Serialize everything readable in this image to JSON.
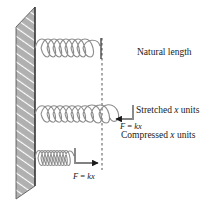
{
  "figure": {
    "background_color": "#ffffff",
    "ink_color": "#1a1a1a",
    "wall_fill": "#b3b3b3",
    "wall_hatch_color": "#ffffff",
    "spring_color": "#8c8c8c"
  },
  "labels": {
    "natural_length": "Natural length",
    "stretched_prefix": "Stretched ",
    "stretched_var": "x",
    "stretched_suffix": " units",
    "compressed_prefix": "Compressed ",
    "compressed_var": "x",
    "compressed_suffix": " units"
  },
  "formulas": {
    "stretched_force_lhs": "F",
    "stretched_force_eq": " = ",
    "stretched_force_k": "k",
    "stretched_force_x": "x",
    "compressed_force_lhs": "F",
    "compressed_force_eq": " = ",
    "compressed_force_k": "k",
    "compressed_force_x": "x"
  },
  "geometry": {
    "wall_label": "fixed-wall",
    "natural_line_label": "natural-length-reference-line",
    "spring_natural_label": "spring-natural",
    "spring_stretched_label": "spring-stretched",
    "spring_compressed_label": "spring-compressed",
    "arrow_stretched_direction": "left",
    "arrow_compressed_direction": "right",
    "reference_line_x": 102,
    "spring_rows_y": [
      48,
      114,
      158
    ]
  }
}
